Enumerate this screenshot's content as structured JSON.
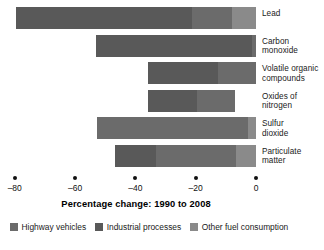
{
  "chart_data": {
    "type": "bar",
    "orientation": "horizontal",
    "stacked": true,
    "title": "",
    "xlabel": "Percentage change: 1990 to 2008",
    "ylabel": "",
    "xlim": [
      -80,
      0
    ],
    "xticks": [
      -80,
      -60,
      -40,
      -20,
      0
    ],
    "xtick_labels": [
      "–80",
      "–60",
      "–40",
      "–20",
      "0"
    ],
    "grid": false,
    "legend_position": "bottom",
    "categories": [
      "Lead",
      "Carbon monoxide",
      "Volatile organic compounds",
      "Oxides of nitrogen",
      "Sulfur dioxide",
      "Particulate matter"
    ],
    "series": [
      {
        "name": "Highway vehicles",
        "color": "#6b6b6b",
        "values": [
          -13.3,
          -1.2,
          -12.6,
          -12.6,
          -50.0,
          -26.5
        ]
      },
      {
        "name": "Industrial processes",
        "color": "#595959",
        "values": [
          -58.4,
          -51.8,
          -23.2,
          -16.3,
          0.0,
          -13.6
        ]
      },
      {
        "name": "Other fuel consumption",
        "color": "#8a8a8a",
        "values": [
          -8.0,
          0.0,
          0.0,
          0.0,
          -2.7,
          -6.6
        ]
      }
    ],
    "totals": [
      -79.6,
      -53.0,
      -35.8,
      -35.8,
      -52.7,
      -46.7
    ]
  },
  "axis": {
    "title": "Percentage change: 1990 to 2008"
  },
  "legend": {
    "items": [
      {
        "label": "Highway vehicles",
        "color": "#6b6b6b"
      },
      {
        "label": "Industrial processes",
        "color": "#595959"
      },
      {
        "label": "Other fuel consumption",
        "color": "#8a8a8a"
      }
    ]
  },
  "category_labels": [
    "Lead",
    "Carbon\nmonoxide",
    "Volatile organic\ncompounds",
    "Oxides of\nnitrogen",
    "Sulfur\ndioxide",
    "Particulate\nmatter"
  ]
}
